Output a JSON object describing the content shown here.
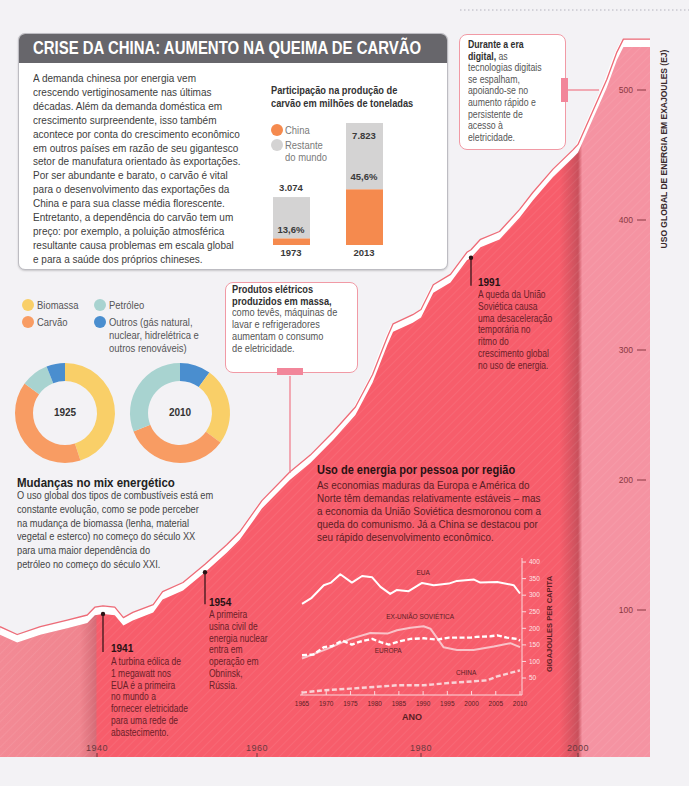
{
  "china_box": {
    "title": "CRISE DA CHINA: AUMENTO NA QUEIMA DE CARVÃO",
    "body_lines": [
      "A demanda chinesa por energia vem",
      "crescendo vertiginosamente nas últimas",
      "décadas. Além da demanda doméstica em",
      "crescimento surpreendente, isso também",
      "acontece por conta do crescimento econômico",
      "em outros países em razão de seu gigantesco",
      "setor de manufatura orientado às exportações.",
      "Por ser abundante e barato, o carvão é vital",
      "para o desenvolvimento das exportações da",
      "China e para sua classe média florescente.",
      "Entretanto, a dependência do carvão tem um",
      "preço: por exemplo, a poluição atmosférica",
      "resultante causa problemas em escala global",
      "e para a saúde dos próprios chineses."
    ],
    "chart_title_lines": [
      "Participação na produção de",
      "carvão em milhões de toneladas"
    ],
    "legend": [
      {
        "label_lines": [
          "China"
        ],
        "color": "#f58a4e"
      },
      {
        "label_lines": [
          "Restante",
          "do mundo"
        ],
        "color": "#d4d3d3"
      }
    ],
    "bars": [
      {
        "year": "1973",
        "total": "3.074",
        "china_share": "13,6%"
      },
      {
        "year": "2013",
        "total": "7.823",
        "china_share": "45,6%"
      }
    ]
  },
  "digital_note": {
    "lines": [
      {
        "b": "Durante a era"
      },
      {
        "b": "digital,",
        "r": " as"
      },
      {
        "r": "tecnologias digitais"
      },
      {
        "r": "se espalham,"
      },
      {
        "r": "apoiando-se no"
      },
      {
        "r": "aumento rápido e"
      },
      {
        "r": "persistente de"
      },
      {
        "r": "acesso à"
      },
      {
        "r": "eletricidade."
      }
    ]
  },
  "electric_note": {
    "lines": [
      {
        "b": "Produtos elétricos"
      },
      {
        "b": "produzidos em massa,"
      },
      {
        "r": "como tevês, máquinas de"
      },
      {
        "r": "lavar e refrigeradores"
      },
      {
        "r": "aumentam o consumo"
      },
      {
        "r": "de eletricidade."
      }
    ]
  },
  "energy_mix": {
    "legend": [
      {
        "label_lines": [
          "Biomassa"
        ],
        "color": "#f9cf68"
      },
      {
        "label_lines": [
          "Carvão"
        ],
        "color": "#f89c63"
      },
      {
        "label_lines": [
          "Petróleo"
        ],
        "color": "#a8d3d0"
      },
      {
        "label_lines": [
          "Outros (gás natural,",
          "nuclear, hidrelétrica e",
          "outros renováveis)"
        ],
        "color": "#4a8ecf"
      }
    ],
    "donut_labels": [
      "1925",
      "2010"
    ],
    "heading": "Mudanças no mix energético",
    "body_lines": [
      "O uso global dos tipos de combustíveis está em",
      "constante evolução, como se pode perceber",
      "na mudança de biomassa (lenha, material",
      "vegetal e esterco) no começo do século XX",
      "para uma maior dependência do",
      "petróleo no começo do século XXI."
    ]
  },
  "per_capita_section": {
    "heading": "Uso de energia por pessoa por região",
    "body_lines": [
      "As economias maduras da Europa e América do",
      "Norte têm demandas relativamente estáveis – mas",
      "a economia da União Soviética desmoronou com a",
      "queda do comunismo. Já a China se destacou por",
      "seu rápido desenvolvimento econômico."
    ]
  },
  "events": [
    {
      "year": "1941",
      "lines": [
        "A turbina eólica de",
        "1 megawatt nos",
        "EUA é a primeira",
        "no mundo a",
        "fornecer eletricidade",
        "para uma rede de",
        "abastecimento."
      ]
    },
    {
      "year": "1954",
      "lines": [
        "A primeira",
        "usina civil de",
        "energia nuclear",
        "entra em",
        "operação em",
        "Obninsk,",
        "Rússia."
      ]
    },
    {
      "year": "1991",
      "lines": [
        "A queda da União",
        "Soviética causa",
        "uma desaceleração",
        "temporária no",
        "ritmo do",
        "crescimento global",
        "no uso de energia."
      ]
    }
  ],
  "main_chart": {
    "y_axis_title": "USO GLOBAL DE ENERGIA EM EXAJOULES (EJ)"
  },
  "inset_chart": {
    "y_axis_title": "GIGAJOULES PER CAPITA",
    "x_axis_title": "ANO"
  },
  "colors": {
    "area_red": "#f75d6b",
    "area_light": "#f592a1",
    "outline": "#ee6b77",
    "title_bar": "#67666b",
    "note_border": "#f19aa5"
  },
  "chart_data": [
    {
      "id": "global-energy-use",
      "type": "area",
      "ylabel": "USO GLOBAL DE ENERGIA EM EXAJOULES (EJ)",
      "x_ticks": [
        "1940",
        "1960",
        "1980",
        "2000"
      ],
      "y_ticks": [
        100,
        200,
        300,
        400,
        500
      ],
      "grid": false,
      "points": [
        [
          1927,
          81
        ],
        [
          1929.3,
          75
        ],
        [
          1932.4,
          81
        ],
        [
          1936,
          86
        ],
        [
          1938.7,
          90
        ],
        [
          1939.7,
          96
        ],
        [
          1941,
          97
        ],
        [
          1942.5,
          96
        ],
        [
          1943.6,
          88
        ],
        [
          1944.8,
          92
        ],
        [
          1947.4,
          98
        ],
        [
          1948.6,
          108
        ],
        [
          1951.2,
          115
        ],
        [
          1954,
          129
        ],
        [
          1956.5,
          144
        ],
        [
          1958,
          154
        ],
        [
          1960.6,
          178
        ],
        [
          1964,
          200
        ],
        [
          1966.5,
          213
        ],
        [
          1969.3,
          231
        ],
        [
          1972,
          250
        ],
        [
          1974.1,
          275
        ],
        [
          1975.9,
          304
        ],
        [
          1976.6,
          314
        ],
        [
          1979,
          321
        ],
        [
          1980,
          325
        ],
        [
          1982.7,
          344
        ],
        [
          1986.5,
          352
        ],
        [
          1990.1,
          369
        ],
        [
          1991,
          371
        ],
        [
          1991.8,
          379
        ],
        [
          1993.4,
          385
        ],
        [
          1995.1,
          402
        ],
        [
          1996.2,
          415
        ],
        [
          1997.9,
          433
        ],
        [
          1999.6,
          448
        ],
        [
          2000,
          452
        ],
        [
          2002,
          477
        ],
        [
          2004,
          502
        ],
        [
          2005.4,
          523
        ],
        [
          2006.3,
          533
        ],
        [
          2010,
          533
        ]
      ],
      "annotations": [
        "1941",
        "1954",
        "1991",
        "Durante a era digital",
        "Produtos elétricos produzidos em massa"
      ]
    },
    {
      "id": "coal-production",
      "type": "bar",
      "title": "Participação na produção de carvão em milhões de toneladas",
      "categories": [
        "1973",
        "2013"
      ],
      "series": [
        {
          "name": "China",
          "values": [
            418,
            3567
          ]
        },
        {
          "name": "Restante do mundo",
          "values": [
            2656,
            4256
          ]
        }
      ],
      "totals": [
        3074,
        7823
      ],
      "china_share_pct": [
        13.6,
        45.6
      ],
      "stacked": true
    },
    {
      "id": "energy-mix-1925",
      "type": "pie",
      "title": "1925",
      "slices_clockwise_from_top": [
        {
          "label": "Biomassa",
          "value": 45
        },
        {
          "label": "Carvão",
          "value": 40
        },
        {
          "label": "Petróleo",
          "value": 9
        },
        {
          "label": "Outros",
          "value": 6
        }
      ]
    },
    {
      "id": "energy-mix-2010",
      "type": "pie",
      "title": "2010",
      "slices_clockwise_from_top": [
        {
          "label": "Outros",
          "value": 10
        },
        {
          "label": "Biomassa",
          "value": 25
        },
        {
          "label": "Carvão",
          "value": 34
        },
        {
          "label": "Petróleo",
          "value": 31
        }
      ]
    },
    {
      "id": "energy-per-capita",
      "type": "line",
      "xlabel": "ANO",
      "ylabel": "GIGAJOULES PER CAPITA",
      "x_ticks": [
        "1965",
        "1970",
        "1975",
        "1980",
        "1985",
        "1990",
        "1995",
        "2000",
        "2005",
        "2010"
      ],
      "y_ticks": [
        50,
        100,
        150,
        200,
        250,
        300,
        350,
        400
      ],
      "xlim": [
        1965,
        2010
      ],
      "ylim": [
        0,
        400
      ],
      "series": [
        {
          "name": "EUA",
          "style": "solid",
          "color": "#ffffff",
          "label_at": [
            1990,
            367
          ],
          "points": [
            [
              1965,
              274
            ],
            [
              1967,
              292
            ],
            [
              1969.5,
              330
            ],
            [
              1971,
              338
            ],
            [
              1972.9,
              363
            ],
            [
              1975.3,
              338
            ],
            [
              1977.4,
              358
            ],
            [
              1979.5,
              354
            ],
            [
              1981.2,
              325
            ],
            [
              1983.2,
              304
            ],
            [
              1984.6,
              316
            ],
            [
              1987,
              312
            ],
            [
              1989.8,
              337
            ],
            [
              1992.2,
              330
            ],
            [
              1995.3,
              335
            ],
            [
              1997,
              343
            ],
            [
              2000.5,
              347
            ],
            [
              2001.8,
              338
            ],
            [
              2005.3,
              340
            ],
            [
              2008.7,
              330
            ],
            [
              2010,
              305
            ]
          ]
        },
        {
          "name": "EX-UNIÃO SOVIÉTICA",
          "style": "solid",
          "color": "#f9c3c9",
          "label_at": [
            1989.4,
            234
          ],
          "points": [
            [
              1965,
              109
            ],
            [
              1970.2,
              138
            ],
            [
              1975,
              168
            ],
            [
              1979.1,
              186
            ],
            [
              1982.6,
              184
            ],
            [
              1984.6,
              194
            ],
            [
              1987.4,
              202
            ],
            [
              1990.1,
              206
            ],
            [
              1991.5,
              199
            ],
            [
              1994.2,
              143
            ],
            [
              1997,
              135
            ],
            [
              2000.4,
              135
            ],
            [
              2004.6,
              145
            ],
            [
              2008,
              155
            ],
            [
              2010,
              143
            ]
          ]
        },
        {
          "name": "EUROPA",
          "style": "dashed",
          "color": "#ffffff",
          "label_at": [
            1982.8,
            132
          ],
          "points": [
            [
              1965,
              119
            ],
            [
              1967.4,
              121
            ],
            [
              1969.5,
              143
            ],
            [
              1971.2,
              146
            ],
            [
              1973.3,
              163
            ],
            [
              1975.3,
              151
            ],
            [
              1977,
              160
            ],
            [
              1979.5,
              168
            ],
            [
              1981.2,
              158
            ],
            [
              1982.9,
              151
            ],
            [
              1985.3,
              161
            ],
            [
              1987.4,
              168
            ],
            [
              1990.1,
              170
            ],
            [
              1992.9,
              166
            ],
            [
              1995.3,
              172
            ],
            [
              1999.8,
              172
            ],
            [
              2001.1,
              174
            ],
            [
              2003.9,
              176
            ],
            [
              2005.3,
              179
            ],
            [
              2007.3,
              172
            ],
            [
              2009.4,
              168
            ],
            [
              2010,
              163
            ]
          ]
        },
        {
          "name": "CHINA",
          "style": "dashed",
          "color": "#f9d3d7",
          "label_at": [
            1998.9,
            65
          ],
          "points": [
            [
              1965,
              6
            ],
            [
              1969.5,
              13
            ],
            [
              1975,
              18
            ],
            [
              1979.8,
              23
            ],
            [
              1984.6,
              28
            ],
            [
              1990.1,
              28
            ],
            [
              1995.3,
              35
            ],
            [
              2000.4,
              40
            ],
            [
              2003.2,
              43
            ],
            [
              2005.3,
              55
            ],
            [
              2010,
              73
            ]
          ]
        }
      ]
    }
  ]
}
